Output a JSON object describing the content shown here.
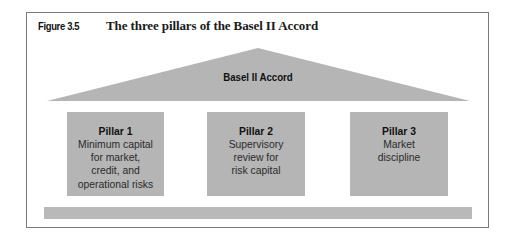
{
  "figure": {
    "label": "Figure 3.5",
    "title": "The three pillars of the Basel II Accord"
  },
  "roof": {
    "label": "Basel II Accord"
  },
  "pillars": [
    {
      "title": "Pillar 1",
      "description": "Minimum capital\nfor market,\ncredit, and\noperational risks"
    },
    {
      "title": "Pillar 2",
      "description": "Supervisory\nreview for\nrisk capital"
    },
    {
      "title": "Pillar 3",
      "description": "Market\ndiscipline"
    }
  ],
  "colors": {
    "shape_fill": "#b5b5b5",
    "frame_border": "#7a7a7a",
    "background": "#ffffff"
  }
}
